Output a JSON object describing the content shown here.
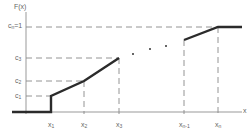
{
  "diagram": {
    "y_axis_label": "F(x)",
    "x_axis_label": "x",
    "y_labels": [
      {
        "base": "c",
        "sub": "n",
        "suffix": "=1"
      },
      {
        "base": "c",
        "sub": "3",
        "suffix": ""
      },
      {
        "base": "c",
        "sub": "2",
        "suffix": ""
      },
      {
        "base": "c",
        "sub": "1",
        "suffix": ""
      }
    ],
    "x_labels": [
      {
        "base": "x",
        "sub": "1"
      },
      {
        "base": "x",
        "sub": "2"
      },
      {
        "base": "x",
        "sub": "3"
      },
      {
        "base": "x",
        "sub": "n-1"
      },
      {
        "base": "x",
        "sub": "n"
      }
    ],
    "ellipsis": "· · ·",
    "colors": {
      "curve": "#2b2b2b",
      "axis": "#999999",
      "dashed": "#888888",
      "text": "#666666"
    }
  }
}
